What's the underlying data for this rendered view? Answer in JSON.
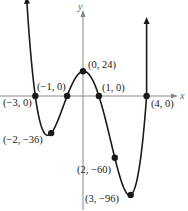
{
  "chart_data": {
    "type": "line",
    "title": "",
    "xlabel": "x",
    "ylabel": "y",
    "function": "f(x) = 2(x+3)(x+1)(x-1)(x-4)",
    "xlim": [
      -4.0,
      5.0
    ],
    "ylim": [
      -110,
      50
    ],
    "grid": false,
    "legend": null,
    "labeled_points": [
      {
        "x": -3,
        "y": 0,
        "label": "(−3, 0)"
      },
      {
        "x": -2,
        "y": -36,
        "label": "(−2, −36)"
      },
      {
        "x": -1,
        "y": 0,
        "label": "(−1, 0)"
      },
      {
        "x": 0,
        "y": 24,
        "label": "(0, 24)"
      },
      {
        "x": 1,
        "y": 0,
        "label": "(1, 0)"
      },
      {
        "x": 2,
        "y": -60,
        "label": "(2, −60)"
      },
      {
        "x": 3,
        "y": -96,
        "label": "(3, −96)"
      },
      {
        "x": 4,
        "y": 0,
        "label": "(4, 0)"
      }
    ]
  },
  "axes": {
    "x_label": "x",
    "y_label": "y"
  },
  "colors": {
    "curve": "#1a1a1a",
    "axis": "#888888"
  }
}
